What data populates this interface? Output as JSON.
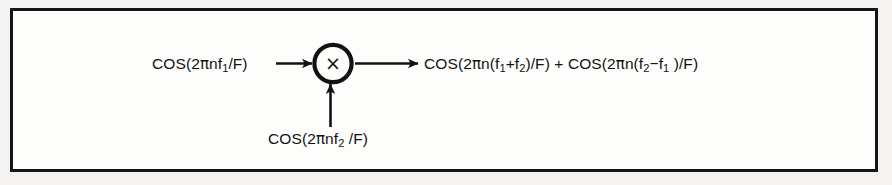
{
  "figure": {
    "type": "signal-flow-diagram",
    "background_color": "#f4f3f1",
    "panel_color": "#fdfdfc",
    "line_color": "#121212",
    "border_color": "#151515"
  },
  "block": {
    "name": "multiplier",
    "symbol": "×",
    "shape": "circle"
  },
  "labels": {
    "input_1": {
      "prefix": "COS",
      "open": "(2",
      "pi": "π",
      "mid": "nf",
      "sub": "1",
      "suffix": "/F)",
      "plain": "COS(2πnf₁/F)"
    },
    "input_2": {
      "prefix": "COS",
      "open": "(2",
      "pi": "π",
      "mid": "nf",
      "sub": "2",
      "suffix": " /F)",
      "plain": "COS(2πnf₂ /F)"
    },
    "output": {
      "term_1_prefix": "COS",
      "term_1_open": "(2",
      "term_1_pi": "π",
      "term_1_n": "n(f",
      "term_1_sub_a": "1",
      "term_1_op": "+f",
      "term_1_sub_b": "2",
      "term_1_close": ")/F)",
      "plus": " + ",
      "term_2_prefix": "COS",
      "term_2_open": "(2",
      "term_2_pi": "π",
      "term_2_n": "n(f",
      "term_2_sub_a": "2",
      "term_2_op": "−f",
      "term_2_sub_b": "1",
      "term_2_close": " )/F)",
      "plain": "COS(2πn(f₁+f₂)/F) + COS(2πn(f₂−f₁)/F)"
    }
  },
  "arrows": [
    {
      "name": "input-1-arrow",
      "direction": "right",
      "from": "input-1-label",
      "to": "multiplier"
    },
    {
      "name": "input-2-arrow",
      "direction": "up",
      "from": "input-2-label",
      "to": "multiplier"
    },
    {
      "name": "output-arrow",
      "direction": "right",
      "from": "multiplier",
      "to": "output-label"
    }
  ]
}
